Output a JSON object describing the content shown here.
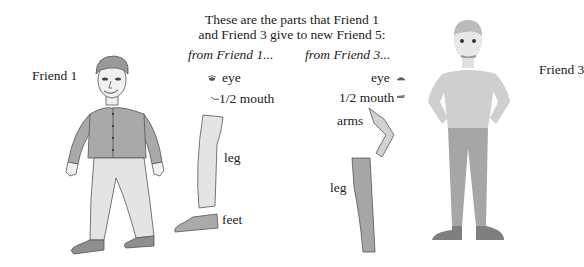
{
  "title": {
    "line1": "These are the parts that Friend 1",
    "line2": "and Friend 3 give to new Friend 5:"
  },
  "columns": {
    "from_friend1": "from Friend 1...",
    "from_friend3": "from Friend 3..."
  },
  "figures": {
    "friend1": {
      "label": "Friend 1"
    },
    "friend3": {
      "label": "Friend 3"
    }
  },
  "parts_friend1": [
    {
      "label": "eye",
      "icon": "eye-icon"
    },
    {
      "label": "1/2 mouth",
      "icon": "half-mouth-icon"
    },
    {
      "label": "leg",
      "icon": "leg-icon"
    },
    {
      "label": "feet",
      "icon": "shoe-icon"
    }
  ],
  "parts_friend3": [
    {
      "label": "eye",
      "icon": "eye-icon"
    },
    {
      "label": "1/2 mouth",
      "icon": "half-mouth-icon"
    },
    {
      "label": "arms",
      "icon": "arm-icon"
    },
    {
      "label": "leg",
      "icon": "leg-icon"
    }
  ],
  "colors": {
    "jacket": "#a9a9a9",
    "pants_light": "#e4e4e4",
    "shoe": "#8f8f8f",
    "skin": "#f0f0f0",
    "friend3_shirt": "#cfcfcf",
    "friend3_pants": "#a6a6a6",
    "friend3_shoe": "#7f7f7f",
    "outline": "#555555"
  }
}
